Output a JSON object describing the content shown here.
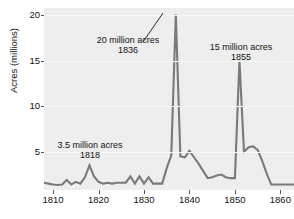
{
  "chart_data": {
    "type": "line",
    "title": "",
    "subtitle": "",
    "xlabel": "",
    "ylabel": "Acres (millions)",
    "xlim": [
      1808,
      1863
    ],
    "ylim": [
      0.8,
      20.8
    ],
    "grid": true,
    "legend_position": "none",
    "line_color": "#7a7a7a",
    "plot_bg_color": "#eeeeee",
    "figure_bg_color": "#ffffff",
    "text_color": "#111111",
    "x_ticks": [
      1810,
      1820,
      1830,
      1840,
      1850,
      1860
    ],
    "x_tick_labels": [
      "1810",
      "1820",
      "1830",
      "1840",
      "1850",
      "1860"
    ],
    "y_ticks": [
      5,
      10,
      15,
      20
    ],
    "y_tick_labels": [
      "5",
      "10",
      "15",
      "20"
    ],
    "series": [
      {
        "name": "Public land sales",
        "x": [
          1808,
          1809,
          1810,
          1811,
          1812,
          1813,
          1814,
          1815,
          1816,
          1817,
          1818,
          1819,
          1820,
          1821,
          1822,
          1823,
          1824,
          1825,
          1826,
          1827,
          1828,
          1829,
          1830,
          1831,
          1832,
          1833,
          1834,
          1835,
          1836,
          1837,
          1838,
          1839,
          1840,
          1841,
          1842,
          1843,
          1844,
          1845,
          1846,
          1847,
          1848,
          1849,
          1850,
          1851,
          1852,
          1853,
          1854,
          1855,
          1856,
          1857,
          1858,
          1859,
          1860,
          1861,
          1862,
          1863
        ],
        "y": [
          1.6,
          1.5,
          1.4,
          1.35,
          1.4,
          1.9,
          1.4,
          1.7,
          1.5,
          2.2,
          3.5,
          2.3,
          1.7,
          1.5,
          1.6,
          1.5,
          1.6,
          1.6,
          1.6,
          2.3,
          1.5,
          2.3,
          1.5,
          2.2,
          1.5,
          1.5,
          1.5,
          3.2,
          4.6,
          20.1,
          4.5,
          4.4,
          5.1,
          4.4,
          3.7,
          2.9,
          2.1,
          2.2,
          2.4,
          2.5,
          2.2,
          2.1,
          2.1,
          15.0,
          5.0,
          5.5,
          5.6,
          5.2,
          4.0,
          2.6,
          1.4,
          1.4,
          1.4,
          1.4,
          1.4,
          1.4
        ],
        "note": "x values re-indexed to match visual peaks at 1836 and 1855"
      }
    ],
    "annotations": [
      {
        "id": "annotation-1836",
        "line1": "20 million acres",
        "line2": "1836",
        "value": 20,
        "year": 1836,
        "x_px": 128,
        "y_px": 35,
        "has_leader": true,
        "leader": {
          "x1": 143,
          "y1": 42,
          "x2": 163,
          "y2": 13
        }
      },
      {
        "id": "annotation-1855",
        "line1": "15 million acres",
        "line2": "1855",
        "value": 15,
        "year": 1855,
        "x_px": 241,
        "y_px": 42,
        "has_leader": false
      },
      {
        "id": "annotation-1818",
        "line1": "3.5 million acres",
        "line2": "1818",
        "value": 3.5,
        "year": 1818,
        "x_px": 90,
        "y_px": 140,
        "has_leader": false
      }
    ]
  },
  "caption": {
    "text": ""
  }
}
